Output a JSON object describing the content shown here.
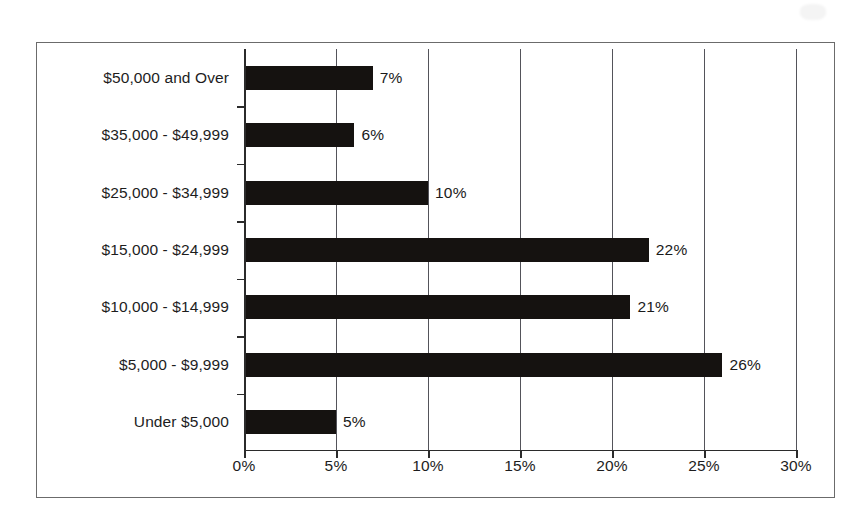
{
  "chart_data": {
    "type": "bar",
    "orientation": "horizontal",
    "title": "",
    "subtitle": "",
    "xlabel": "",
    "ylabel": "",
    "categories": [
      "$50,000 and Over",
      "$35,000 - $49,999",
      "$25,000 - $34,999",
      "$15,000 - $24,999",
      "$10,000 - $14,999",
      "$5,000 - $9,999",
      "Under $5,000"
    ],
    "values": [
      7,
      6,
      10,
      22,
      21,
      26,
      5
    ],
    "value_labels": [
      "7%",
      "6%",
      "10%",
      "22%",
      "21%",
      "26%",
      "5%"
    ],
    "xlim": [
      0,
      30
    ],
    "xticks": [
      0,
      5,
      10,
      15,
      20,
      25,
      30
    ],
    "xtick_labels": [
      "0%",
      "5%",
      "10%",
      "15%",
      "20%",
      "25%",
      "30%"
    ],
    "grid": true,
    "grid_axis": "x",
    "legend": false,
    "legend_position": "none",
    "bar_color": "#151210",
    "axis_color": "#2b2b2b",
    "grid_color": "#53535a",
    "background_color": "#ffffff",
    "frame_color": "#6b6b6b"
  }
}
